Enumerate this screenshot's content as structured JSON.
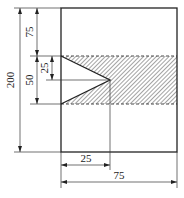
{
  "diagram": {
    "type": "engineering-dimension-drawing",
    "dimensions": {
      "total_height": "200",
      "top_to_band": "75",
      "band_height": "50",
      "notch_half_height": "25",
      "notch_depth": "25",
      "total_width": "75"
    },
    "colors": {
      "line": "#222222",
      "hatch": "#555555",
      "background": "#ffffff"
    }
  }
}
